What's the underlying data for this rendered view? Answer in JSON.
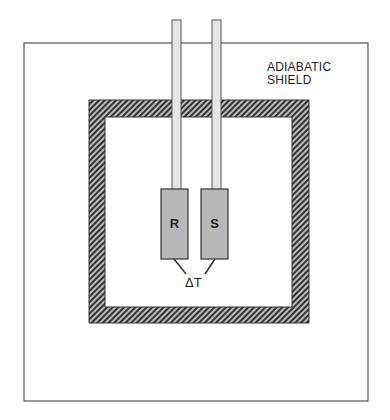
{
  "diagram": {
    "shield_label_line1": "ADIABATIC",
    "shield_label_line2": "SHIELD",
    "reference_label": "R",
    "sample_label": "S",
    "delta_t_label": "ΔT",
    "colors": {
      "outline": "#444444",
      "block_fill": "#b8b8b8",
      "tube_fill": "#e4e4e4",
      "hatch_dark": "#333333",
      "hatch_light": "#bbbbbb"
    }
  }
}
